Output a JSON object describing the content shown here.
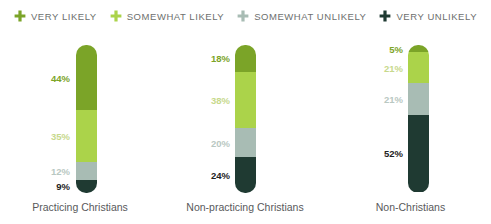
{
  "legend": {
    "items": [
      {
        "label": "VERY LIKELY",
        "icon": "plus-cross-icon",
        "color": "#7aa party"
      }
    ]
  },
  "chart_data": {
    "type": "bar",
    "subtype": "stacked-vertical-100",
    "title": "",
    "xlabel": "",
    "ylabel": "",
    "ylim": [
      0,
      100
    ],
    "grid": false,
    "legend_position": "top-center",
    "categories": [
      "Practicing Christians",
      "Non-practicing Christians",
      "Non-Christians"
    ],
    "series": [
      {
        "name": "VERY LIKELY",
        "color": "#7ba428",
        "values": [
          44,
          18,
          5
        ]
      },
      {
        "name": "SOMEWHAT LIKELY",
        "color": "#abd34a",
        "values": [
          35,
          38,
          21
        ]
      },
      {
        "name": "SOMEWHAT UNLIKELY",
        "color": "#a8bcb4",
        "values": [
          12,
          20,
          21
        ]
      },
      {
        "name": "VERY UNLIKELY",
        "color": "#1f3a32",
        "values": [
          9,
          24,
          52
        ]
      }
    ],
    "value_labels": [
      [
        "44%",
        "35%",
        "12%",
        "9%"
      ],
      [
        "18%",
        "38%",
        "20%",
        "24%"
      ],
      [
        "5%",
        "21%",
        "21%",
        "52%"
      ]
    ]
  },
  "legend_entries": [
    {
      "label": "VERY LIKELY",
      "icon": "plus-cross-icon",
      "color": "#7ba428"
    },
    {
      "label": "SOMEWHAT LIKELY",
      "icon": "plus-cross-icon",
      "color": "#abd34a"
    },
    {
      "label": "SOMEWHAT UNLIKELY",
      "icon": "plus-cross-icon",
      "color": "#a8bcb4"
    },
    {
      "label": "VERY UNLIKELY",
      "icon": "plus-cross-icon",
      "color": "#1f3a32"
    }
  ],
  "label_text_colors": [
    "#7ba428",
    "#c7d98c",
    "#b9c8c2",
    "#222222"
  ]
}
